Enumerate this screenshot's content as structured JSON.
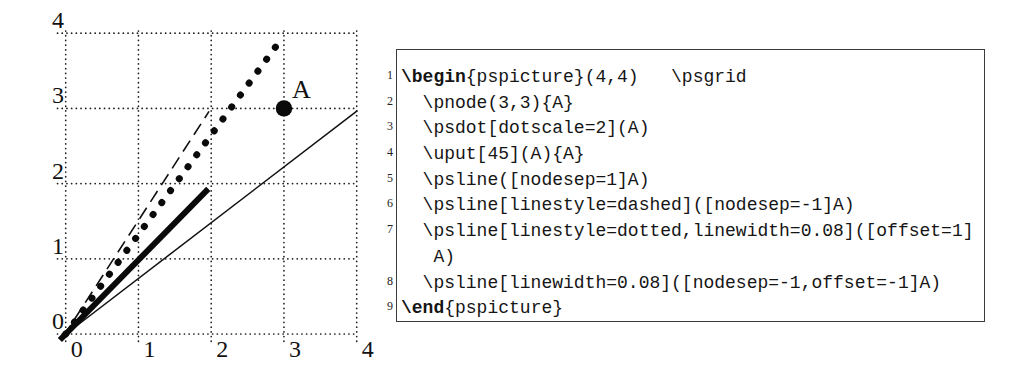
{
  "figure": {
    "x_tick_labels": [
      "0",
      "1",
      "2",
      "3",
      "4"
    ],
    "y_tick_labels": [
      "0",
      "1",
      "2",
      "3",
      "4"
    ],
    "node": {
      "x": 3,
      "y": 3,
      "label": "A",
      "dot_radius": 8.2
    },
    "lines": [
      {
        "name": "line-solid-thin",
        "style": "thin",
        "from": [
          -0.05,
          -0.04
        ],
        "to": [
          4.01,
          2.97
        ]
      },
      {
        "name": "line-dashed",
        "style": "dashed",
        "from": [
          -0.03,
          -0.03
        ],
        "to": [
          1.97,
          2.96
        ]
      },
      {
        "name": "line-dotted-thick",
        "style": "dotted",
        "from": [
          0,
          0
        ],
        "to": [
          2.985,
          3.95
        ]
      },
      {
        "name": "line-solid-thick",
        "style": "thick",
        "from": [
          -0.08,
          -0.08
        ],
        "to": [
          1.96,
          1.93
        ]
      }
    ]
  },
  "code": {
    "rows": [
      {
        "num": "1",
        "segments": [
          {
            "t": "\\begin",
            "b": true
          },
          {
            "t": "{pspicture}(4,4)   \\psgrid",
            "b": false
          }
        ]
      },
      {
        "num": "2",
        "segments": [
          {
            "t": "  \\pnode(3,3){A}",
            "b": false
          }
        ]
      },
      {
        "num": "3",
        "segments": [
          {
            "t": "  \\psdot[dotscale=2](A)",
            "b": false
          }
        ]
      },
      {
        "num": "4",
        "segments": [
          {
            "t": "  \\uput[45](A){A}",
            "b": false
          }
        ]
      },
      {
        "num": "5",
        "segments": [
          {
            "t": "  \\psline([nodesep=1]A)",
            "b": false
          }
        ]
      },
      {
        "num": "6",
        "segments": [
          {
            "t": "  \\psline[linestyle=dashed]([nodesep=-1]A)",
            "b": false
          }
        ]
      },
      {
        "num": "7",
        "segments": [
          {
            "t": "  \\psline[linestyle=dotted,linewidth=0.08]([offset=1]",
            "b": false
          }
        ]
      },
      {
        "num": "",
        "segments": [
          {
            "t": "   A)",
            "b": false
          }
        ]
      },
      {
        "num": "8",
        "segments": [
          {
            "t": "  \\psline[linewidth=0.08]([nodesep=-1,offset=-1]A)",
            "b": false
          }
        ]
      },
      {
        "num": "9",
        "segments": [
          {
            "t": "\\end",
            "b": true
          },
          {
            "t": "{pspicture}",
            "b": false
          }
        ]
      }
    ]
  },
  "colors": {
    "ink": "#111111",
    "border": "#3c3c3c",
    "background": "#ffffff"
  }
}
